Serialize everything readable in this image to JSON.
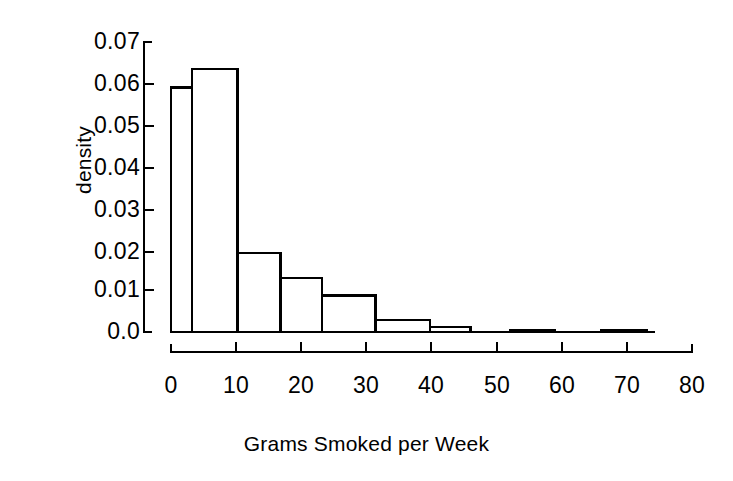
{
  "chart_data": {
    "type": "bar",
    "subtype": "histogram",
    "title": "",
    "xlabel": "Grams Smoked per Week",
    "ylabel": "density",
    "xlim": [
      0,
      80
    ],
    "ylim": [
      0.0,
      0.07
    ],
    "grid": false,
    "legend": null,
    "xticks": [
      0,
      10,
      20,
      30,
      40,
      50,
      60,
      70,
      80
    ],
    "xtick_labels": [
      "0",
      "10",
      "20",
      "30",
      "40",
      "50",
      "60",
      "70",
      "80"
    ],
    "yticks": [
      0.0,
      0.01,
      0.02,
      0.03,
      0.04,
      0.05,
      0.06,
      0.07
    ],
    "ytick_labels": [
      "0.0",
      "0.01",
      "0.02",
      "0.03",
      "0.04",
      "0.05",
      "0.06",
      "0.07"
    ],
    "bin_edges": [
      0,
      3.2,
      10.2,
      16.8,
      23.2,
      31.4,
      39.8,
      46.0,
      52.0,
      59.0,
      66.0,
      73.0
    ],
    "bars": [
      {
        "x0": 0,
        "x1": 3.2,
        "height": 0.059
      },
      {
        "x0": 3.2,
        "x1": 10.2,
        "height": 0.0635
      },
      {
        "x0": 10.2,
        "x1": 16.8,
        "height": 0.019
      },
      {
        "x0": 16.8,
        "x1": 23.2,
        "height": 0.013
      },
      {
        "x0": 23.2,
        "x1": 31.4,
        "height": 0.0088
      },
      {
        "x0": 31.4,
        "x1": 39.8,
        "height": 0.0029
      },
      {
        "x0": 39.8,
        "x1": 46.0,
        "height": 0.0012
      },
      {
        "x0": 52.0,
        "x1": 59.0,
        "height": 0.0003
      },
      {
        "x0": 66.0,
        "x1": 73.0,
        "height": 0.0003
      }
    ],
    "values": [
      0.059,
      0.0635,
      0.019,
      0.013,
      0.0088,
      0.0029,
      0.0012,
      0.0003,
      0.0003
    ],
    "categories": [
      "0-3.2",
      "3.2-10.2",
      "10.2-16.8",
      "16.8-23.2",
      "23.2-31.4",
      "31.4-39.8",
      "39.8-46",
      "52-59",
      "66-73"
    ],
    "colors": {
      "bar_fill": "#ffffff",
      "bar_stroke": "#000000",
      "axis": "#000000",
      "background": "#ffffff"
    }
  }
}
